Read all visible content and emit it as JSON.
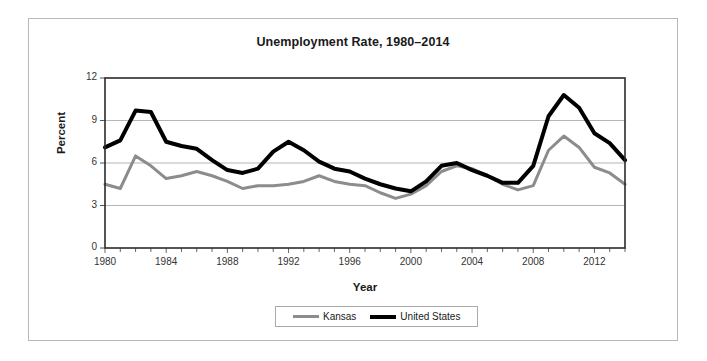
{
  "chart_data": {
    "type": "line",
    "title": "Unemployment Rate, 1980–2014",
    "xlabel": "Year",
    "ylabel": "Percent",
    "xlim": [
      1980,
      2014
    ],
    "ylim": [
      0,
      12
    ],
    "y_ticks": [
      0,
      3,
      6,
      9,
      12
    ],
    "x_ticks": [
      1980,
      1984,
      1988,
      1992,
      1996,
      2000,
      2004,
      2008,
      2012
    ],
    "x_tick_labels": [
      "1980",
      "1984",
      "1988",
      "1992",
      "1996",
      "2000",
      "2004",
      "2008",
      "2012"
    ],
    "y_tick_labels": [
      "0",
      "3",
      "6",
      "9",
      "12"
    ],
    "grid": "horizontal",
    "legend_position": "bottom-center",
    "x": [
      1980,
      1981,
      1982,
      1983,
      1984,
      1985,
      1986,
      1987,
      1988,
      1989,
      1990,
      1991,
      1992,
      1993,
      1994,
      1995,
      1996,
      1997,
      1998,
      1999,
      2000,
      2001,
      2002,
      2003,
      2004,
      2005,
      2006,
      2007,
      2008,
      2009,
      2010,
      2011,
      2012,
      2013,
      2014
    ],
    "series": [
      {
        "name": "Kansas",
        "color": "#8c8c8c",
        "line_width": 3,
        "values": [
          4.5,
          4.2,
          6.5,
          5.8,
          4.9,
          5.1,
          5.4,
          5.1,
          4.7,
          4.2,
          4.4,
          4.4,
          4.5,
          4.7,
          5.1,
          4.7,
          4.5,
          4.4,
          3.9,
          3.5,
          3.8,
          4.4,
          5.4,
          5.8,
          5.6,
          5.1,
          4.5,
          4.1,
          4.4,
          6.9,
          7.9,
          7.1,
          5.7,
          5.3,
          4.5
        ]
      },
      {
        "name": "United States",
        "color": "#000000",
        "line_width": 4,
        "values": [
          7.1,
          7.6,
          9.7,
          9.6,
          7.5,
          7.2,
          7.0,
          6.2,
          5.5,
          5.3,
          5.6,
          6.8,
          7.5,
          6.9,
          6.1,
          5.6,
          5.4,
          4.9,
          4.5,
          4.2,
          4.0,
          4.7,
          5.8,
          6.0,
          5.5,
          5.1,
          4.6,
          4.6,
          5.8,
          9.3,
          10.8,
          9.9,
          8.1,
          7.4,
          6.2
        ]
      }
    ]
  },
  "legend": {
    "items": [
      {
        "label": "Kansas"
      },
      {
        "label": "United States"
      }
    ]
  }
}
